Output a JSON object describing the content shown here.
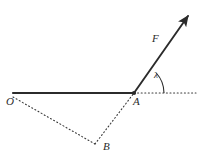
{
  "figure": {
    "background_color": "#ffffff",
    "stroke_color": "#2b2b2b",
    "caption": "",
    "labels": {
      "origin": "O",
      "vertex": "A",
      "point_b": "B",
      "force_vector": "F",
      "angle": "λ"
    },
    "geometry": {
      "points": {
        "O": {
          "x": 13,
          "y": 93
        },
        "A": {
          "x": 134,
          "y": 93
        },
        "B": {
          "x": 96,
          "y": 145
        },
        "F_tip": {
          "x": 193,
          "y": 11
        },
        "dotted_ray_end": {
          "x": 196,
          "y": 93
        }
      },
      "segments": [
        {
          "name": "OA-solid-beam",
          "from": "O",
          "to": "A",
          "style": "solid"
        },
        {
          "name": "O-to-B-dotted",
          "from": "O",
          "to": "B",
          "style": "dotted"
        },
        {
          "name": "B-to-A-dotted",
          "from": "B",
          "to": "A",
          "style": "dotted"
        },
        {
          "name": "A-horizontal-dotted-ray",
          "from": "A",
          "to": "dotted_ray_end",
          "style": "dotted"
        },
        {
          "name": "force-arrow",
          "from": "A",
          "to": "F_tip",
          "style": "solid-arrow"
        }
      ],
      "angle_arc": {
        "vertex": "A",
        "radius": 30,
        "from_deg": 0,
        "to_deg": 42
      }
    }
  }
}
